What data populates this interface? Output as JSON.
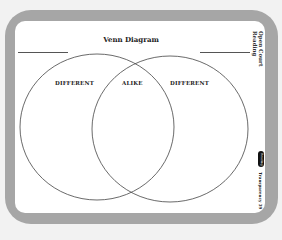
{
  "title": "Venn Diagram",
  "labels": {
    "left": "DIFFERENT",
    "middle": "ALIKE",
    "right": "DIFFERENT"
  },
  "logo": "Open Court Reading",
  "badge": "Reading",
  "footer": "Transparency 39",
  "colors": {
    "frame": "#a6a6a6",
    "sheet": "#ffffff",
    "stroke": "#444444"
  }
}
